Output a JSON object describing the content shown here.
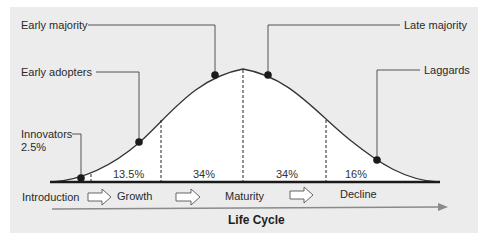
{
  "diagram": {
    "title": "Life Cycle",
    "adopter_labels": {
      "innovators": "Innovators",
      "innovators_pct": "2.5%",
      "early_adopters": "Early adopters",
      "early_majority": "Early majority",
      "late_majority": "Late majority",
      "laggards": "Laggards"
    },
    "segment_percentages": [
      "13.5%",
      "34%",
      "34%",
      "16%"
    ],
    "stages": [
      "Introduction",
      "Growth",
      "Maturity",
      "Decline"
    ],
    "colors": {
      "panel_background": "#ececec",
      "curve_fill": "#ffffff",
      "curve_line": "#333333",
      "baseline": "#1a1a1a",
      "lifecycle_arrow": "#8a8a8a",
      "dots": "#1a1a1a"
    }
  }
}
